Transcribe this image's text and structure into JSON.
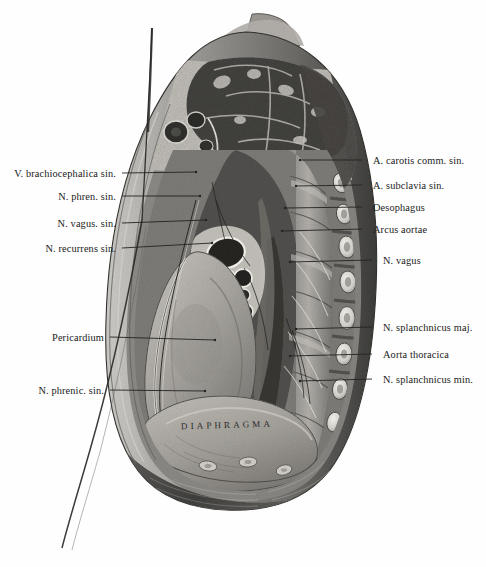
{
  "plate": {
    "title": "Thorax cross-section, left pleural cavity",
    "inline_label": "Diaphragma",
    "background_color": "#ffffff",
    "ink_color": "#1a1a1a"
  },
  "labels_left": [
    {
      "text": "V. brachiocephalica sin.",
      "y": 177,
      "lead_x1": 122,
      "lead_x2": 196,
      "lead_y2": 172
    },
    {
      "text": "N. phren. sin.",
      "y": 200,
      "lead_x1": 122,
      "lead_x2": 200,
      "lead_y2": 196
    },
    {
      "text": "N. vagus. sin.",
      "y": 227,
      "lead_x1": 122,
      "lead_x2": 206,
      "lead_y2": 220
    },
    {
      "text": "N. recurrens sin.",
      "y": 252,
      "lead_x1": 122,
      "lead_x2": 212,
      "lead_y2": 243
    },
    {
      "text": "Pericardium",
      "y": 341,
      "lead_x1": 110,
      "lead_x2": 215,
      "lead_y2": 340
    },
    {
      "text": "N. phrenic. sin.",
      "y": 394,
      "lead_x1": 110,
      "lead_x2": 205,
      "lead_y2": 391
    }
  ],
  "labels_right": [
    {
      "text": "A. carotis comm. sin.",
      "y": 164,
      "lead_x1": 362,
      "lead_x2": 300,
      "lead_y2": 160
    },
    {
      "text": "A. subclavia sin.",
      "y": 189,
      "lead_x1": 362,
      "lead_x2": 296,
      "lead_y2": 186
    },
    {
      "text": "Oesophagus",
      "y": 211,
      "lead_x1": 362,
      "lead_x2": 285,
      "lead_y2": 208
    },
    {
      "text": "Arcus aortae",
      "y": 233,
      "lead_x1": 362,
      "lead_x2": 282,
      "lead_y2": 231
    },
    {
      "text": "N. vagus",
      "y": 264,
      "lead_x1": 372,
      "lead_x2": 290,
      "lead_y2": 262
    },
    {
      "text": "N. splanchnicus maj.",
      "y": 331,
      "lead_x1": 372,
      "lead_x2": 296,
      "lead_y2": 329
    },
    {
      "text": "Aorta thoracica",
      "y": 358,
      "lead_x1": 372,
      "lead_x2": 290,
      "lead_y2": 356
    },
    {
      "text": "N. splanchnicus min.",
      "y": 383,
      "lead_x1": 372,
      "lead_x2": 300,
      "lead_y2": 381
    }
  ]
}
